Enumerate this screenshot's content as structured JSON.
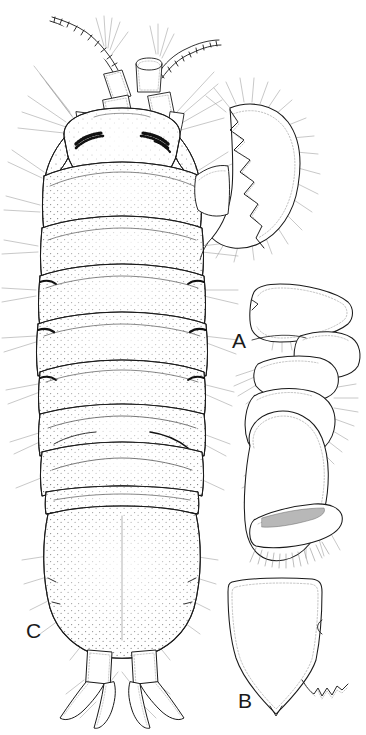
{
  "figure": {
    "kind": "scientific-line-drawing-plate",
    "background_color": "#ffffff",
    "ink_color": "#1a1a1a",
    "stipple_color": "#4a4a4a",
    "seta_color": "#8a8a8a",
    "width_px": 366,
    "height_px": 735
  },
  "panels": [
    {
      "id": "C",
      "label": "C",
      "label_x": 26,
      "label_y": 620,
      "description": "dorsal habitus, whole animal",
      "parts": [
        "left antenna with segmented flagellum",
        "right antenna with segmented flagellum",
        "antennule peduncle articles",
        "left compound eye",
        "right compound eye",
        "cephalon",
        "pereonite 1",
        "pereonite 2",
        "pereonite 3",
        "pereonite 4",
        "pereonite 5",
        "pereonite 6",
        "pereonite 7",
        "pleon",
        "pleotelson",
        "left uropod",
        "right uropod",
        "coxal plates",
        "marginal setae"
      ]
    },
    {
      "id": "claw",
      "label": "",
      "description": "crescentic claw / mandible with serrate inner margin, attached upper right of habitus",
      "parts": [
        "outer crescent margin",
        "serrate inner margin",
        "marginal setal fringe"
      ]
    },
    {
      "id": "A",
      "label": "A",
      "label_x": 232,
      "label_y": 330,
      "description": "pereopod / maxilliped, articulated appendage",
      "parts": [
        "basis",
        "ischium",
        "merus",
        "carpus",
        "propodus",
        "dactylus",
        "setal fringe"
      ]
    },
    {
      "id": "B",
      "label": "B",
      "label_x": 238,
      "label_y": 690,
      "description": "pleotelson / operculum plate, outline with dotted inner margin",
      "parts": [
        "plate outline",
        "dotted inner margin",
        "apical point",
        "zigzag margin enlargement"
      ]
    }
  ],
  "labels": {
    "a": "A",
    "b": "B",
    "c": "C"
  }
}
